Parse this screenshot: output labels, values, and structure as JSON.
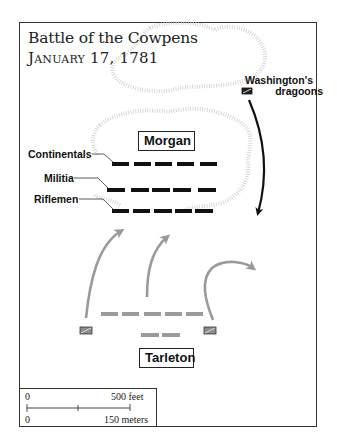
{
  "title": {
    "line1": "Battle of the Cowpens",
    "line2": "January 17, 1781"
  },
  "labels": {
    "morgan": "Morgan",
    "tarleton": "Tarleton",
    "continentals": "Continentals",
    "militia": "Militia",
    "riflemen": "Riflemen",
    "dragoons_line1": "Washington's",
    "dragoons_line2": "dragoons"
  },
  "scale_bar": {
    "top_left": "0",
    "top_right": "500 feet",
    "bottom_left": "0",
    "bottom_right": "150 meters"
  },
  "colors": {
    "american_units": "#111111",
    "british_units": "#9a9a9a",
    "hill_outline": "#c8c8c8",
    "frame": "#333333"
  }
}
